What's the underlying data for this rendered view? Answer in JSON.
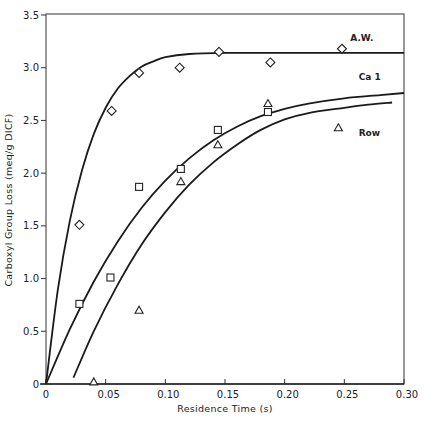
{
  "chart_data": {
    "type": "scatter",
    "title": "",
    "xlabel": "Residence Time (s)",
    "ylabel": "Carboxyl Group Loss (meq/g DICF)",
    "xlim": [
      0,
      0.3
    ],
    "ylim": [
      0,
      3.5
    ],
    "x_ticks": [
      "0",
      "0.05",
      "0.10",
      "0.15",
      "0.20",
      "0.25",
      "0.30"
    ],
    "x_tick_values": [
      0,
      0.05,
      0.1,
      0.15,
      0.2,
      0.25,
      0.3
    ],
    "y_ticks": [
      "0",
      "0.5",
      "1.0",
      "1.5",
      "2.0",
      "2.5",
      "3.0",
      "3.5"
    ],
    "y_tick_values": [
      0,
      0.5,
      1.0,
      1.5,
      2.0,
      2.5,
      3.0,
      3.5
    ],
    "grid": false,
    "legend_position": "inline labels at right end of curves",
    "series": [
      {
        "name": "A.W.",
        "marker": "diamond",
        "points": [
          {
            "x": 0.028,
            "y": 1.51
          },
          {
            "x": 0.055,
            "y": 2.59
          },
          {
            "x": 0.078,
            "y": 2.95
          },
          {
            "x": 0.112,
            "y": 3.0
          },
          {
            "x": 0.145,
            "y": 3.15
          },
          {
            "x": 0.188,
            "y": 3.05
          },
          {
            "x": 0.248,
            "y": 3.18
          }
        ],
        "fit_curve": [
          [
            0,
            0
          ],
          [
            0.01,
            0.9
          ],
          [
            0.02,
            1.55
          ],
          [
            0.03,
            2.02
          ],
          [
            0.04,
            2.37
          ],
          [
            0.05,
            2.62
          ],
          [
            0.06,
            2.8
          ],
          [
            0.07,
            2.92
          ],
          [
            0.08,
            3.01
          ],
          [
            0.09,
            3.06
          ],
          [
            0.1,
            3.1
          ],
          [
            0.12,
            3.13
          ],
          [
            0.15,
            3.14
          ],
          [
            0.2,
            3.14
          ],
          [
            0.25,
            3.14
          ],
          [
            0.3,
            3.14
          ]
        ]
      },
      {
        "name": "Ca 1",
        "marker": "square",
        "points": [
          {
            "x": 0.028,
            "y": 0.76
          },
          {
            "x": 0.054,
            "y": 1.01
          },
          {
            "x": 0.078,
            "y": 1.87
          },
          {
            "x": 0.113,
            "y": 2.04
          },
          {
            "x": 0.144,
            "y": 2.41
          },
          {
            "x": 0.186,
            "y": 2.58
          }
        ],
        "fit_curve": [
          [
            0,
            0
          ],
          [
            0.02,
            0.52
          ],
          [
            0.04,
            0.97
          ],
          [
            0.06,
            1.35
          ],
          [
            0.08,
            1.67
          ],
          [
            0.1,
            1.93
          ],
          [
            0.12,
            2.14
          ],
          [
            0.14,
            2.31
          ],
          [
            0.16,
            2.44
          ],
          [
            0.18,
            2.54
          ],
          [
            0.2,
            2.61
          ],
          [
            0.22,
            2.66
          ],
          [
            0.25,
            2.71
          ],
          [
            0.28,
            2.74
          ],
          [
            0.3,
            2.76
          ]
        ]
      },
      {
        "name": "Row",
        "marker": "triangle",
        "points": [
          {
            "x": 0.04,
            "y": 0.02
          },
          {
            "x": 0.078,
            "y": 0.7
          },
          {
            "x": 0.113,
            "y": 1.92
          },
          {
            "x": 0.144,
            "y": 2.27
          },
          {
            "x": 0.186,
            "y": 2.66
          },
          {
            "x": 0.245,
            "y": 2.43
          }
        ],
        "fit_curve": [
          [
            0.023,
            0.06
          ],
          [
            0.04,
            0.5
          ],
          [
            0.06,
            0.94
          ],
          [
            0.08,
            1.32
          ],
          [
            0.1,
            1.63
          ],
          [
            0.12,
            1.89
          ],
          [
            0.14,
            2.1
          ],
          [
            0.16,
            2.27
          ],
          [
            0.18,
            2.41
          ],
          [
            0.2,
            2.51
          ],
          [
            0.22,
            2.57
          ],
          [
            0.25,
            2.62
          ],
          [
            0.27,
            2.65
          ],
          [
            0.29,
            2.67
          ]
        ]
      }
    ],
    "annotations": [
      {
        "text": "A.W.",
        "x": 0.255,
        "y": 3.25
      },
      {
        "text": "Ca 1",
        "x": 0.262,
        "y": 2.88
      },
      {
        "text": "Row",
        "x": 0.262,
        "y": 2.35
      }
    ]
  }
}
